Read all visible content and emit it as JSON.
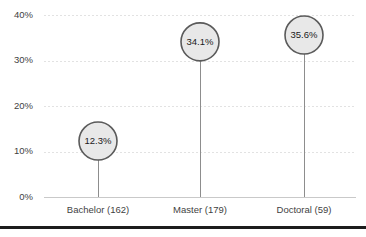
{
  "chart_data": {
    "type": "scatter",
    "title": "",
    "subtitle": "",
    "xlabel": "",
    "ylabel": "",
    "categories": [
      "Bachelor (162)",
      "Master (179)",
      "Doctoral (59)"
    ],
    "values": [
      12.3,
      34.1,
      35.6
    ],
    "value_labels": [
      "12.3%",
      "34.1%",
      "35.6%"
    ],
    "ylim": [
      0,
      40
    ],
    "ytick_values": [
      0,
      10,
      20,
      30,
      40
    ],
    "ytick_labels": [
      "0%",
      "10%",
      "20%",
      "30%",
      "40%"
    ],
    "grid": true,
    "legend": "none",
    "marker": "circle",
    "series": [
      {
        "name": "Percent",
        "values": [
          12.3,
          34.1,
          35.6
        ]
      }
    ]
  },
  "style": {
    "marker_fill": "#e8e8e8",
    "marker_stroke": "#5a5a5a",
    "stem_color": "#8d8d8d",
    "gridline_color": "#e2e2e2",
    "axis_color": "#c9c9c9",
    "text_color": "#3f3f3f",
    "value_text_color": "#1a1a1a",
    "background": "#ffffff",
    "bottom_rule_color": "#1c1c1c"
  },
  "geometry": {
    "width": 366,
    "height": 237,
    "plot_left": 44,
    "plot_right": 356,
    "plot_top": 15,
    "plot_bottom": 197,
    "marker_radius": 19,
    "category_x": [
      98,
      200,
      304
    ],
    "label_y": 210,
    "bottom_rule_y": 226
  }
}
